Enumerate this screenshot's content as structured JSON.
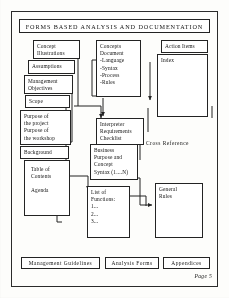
{
  "page": {
    "title": "FORMS  BASED  ANALYSIS  AND  DOCUMENTATION",
    "page_label": "Page 5",
    "ink_color": "#232323",
    "paper_color": "#fdfdfb"
  },
  "left_column": {
    "concept_illustrations": {
      "line1": "Concept",
      "line2": "Illustrations"
    },
    "assumptions": {
      "line1": "Assumptions"
    },
    "management_objectives": {
      "line1": "Management",
      "line2": "Objectives"
    },
    "scope": {
      "line1": "Scope"
    },
    "purpose": {
      "line1": "Purpose   of",
      "line2": "the  project",
      "line3": "Purpose   of",
      "line4": "the  workshop"
    },
    "background": {
      "line1": "Background"
    },
    "table_of_contents": {
      "line1": "Table  of",
      "line2": "Contents",
      "line3": "",
      "line4": "Agenda"
    }
  },
  "middle_column": {
    "concepts_document": {
      "line1": "Concepts",
      "line2": "Document",
      "line3": "-Language",
      "line4": "-Syntax",
      "line5": "-Process",
      "line6": "-Rules"
    },
    "interpreter_checklist": {
      "line1": "Interpreter",
      "line2": "Requirements",
      "line3": "Checklist"
    },
    "business_syntax": {
      "line1": "Business",
      "line2": "Purpose  and",
      "line3": "Concept",
      "line4": "Syntax  (1....N)"
    },
    "list_of_functions": {
      "line1": "List of",
      "line2": "Functions:",
      "line3": "1...",
      "line4": "2...",
      "line5": "3..."
    }
  },
  "right_column": {
    "action_items": {
      "line1": "Action   Items"
    },
    "index": {
      "line1": "Index"
    },
    "cross_reference": {
      "label": "Cross    Reference"
    },
    "general_rules": {
      "line1": "General",
      "line2": "Rules"
    }
  },
  "bottom_tabs": [
    {
      "label": "Management    Guidelines"
    },
    {
      "label": "Analysis  Forms"
    },
    {
      "label": "Appendices"
    }
  ]
}
